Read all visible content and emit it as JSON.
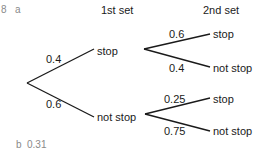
{
  "question": {
    "number": "8",
    "part_a": "a",
    "part_b": "b",
    "answer_b": "0.31"
  },
  "headers": {
    "first": "1st set",
    "second": "2nd set"
  },
  "tree": {
    "first_set": [
      {
        "prob": "0.4",
        "outcome": "stop"
      },
      {
        "prob": "0.6",
        "outcome": "not stop"
      }
    ],
    "second_set_after_stop": [
      {
        "prob": "0.6",
        "outcome": "stop"
      },
      {
        "prob": "0.4",
        "outcome": "not stop"
      }
    ],
    "second_set_after_not_stop": [
      {
        "prob": "0.25",
        "outcome": "stop"
      },
      {
        "prob": "0.75",
        "outcome": "not stop"
      }
    ]
  },
  "colors": {
    "line": "#1a1a1a",
    "text": "#1a1a1a",
    "label_gray": "#8a8a8a"
  }
}
